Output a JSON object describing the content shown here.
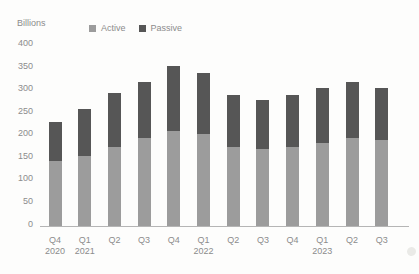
{
  "colors": {
    "background": "#fdfdfc",
    "text": "#8c8c8c",
    "axis_line": "#b5b5b5",
    "active": "#9c9c9c",
    "passive": "#565656"
  },
  "chart_data": {
    "type": "bar",
    "stacked": true,
    "ylabel": "Billions",
    "categories": [
      "Q4 2020",
      "Q1 2021",
      "Q2 2021",
      "Q3 2021",
      "Q4 2021",
      "Q1 2022",
      "Q2 2022",
      "Q3 2022",
      "Q4 2022",
      "Q1 2023",
      "Q2 2023",
      "Q3 2023"
    ],
    "x_ticks": [
      {
        "quarter": "Q4",
        "year": "2020"
      },
      {
        "quarter": "Q1",
        "year": "2021"
      },
      {
        "quarter": "Q2",
        "year": ""
      },
      {
        "quarter": "Q3",
        "year": ""
      },
      {
        "quarter": "Q4",
        "year": ""
      },
      {
        "quarter": "Q1",
        "year": "2022"
      },
      {
        "quarter": "Q2",
        "year": ""
      },
      {
        "quarter": "Q3",
        "year": ""
      },
      {
        "quarter": "Q4",
        "year": ""
      },
      {
        "quarter": "Q1",
        "year": "2023"
      },
      {
        "quarter": "Q2",
        "year": ""
      },
      {
        "quarter": "Q3",
        "year": ""
      }
    ],
    "series": [
      {
        "name": "Active",
        "color": "#9c9c9c",
        "values": [
          145,
          155,
          175,
          195,
          210,
          205,
          175,
          170,
          175,
          185,
          195,
          190
        ]
      },
      {
        "name": "Passive",
        "color": "#565656",
        "values": [
          85,
          105,
          120,
          125,
          145,
          135,
          115,
          110,
          115,
          120,
          125,
          115
        ]
      }
    ],
    "totals": [
      230,
      260,
      295,
      320,
      355,
      340,
      290,
      280,
      290,
      305,
      320,
      305
    ],
    "y_ticks": [
      400,
      350,
      300,
      250,
      200,
      150,
      100,
      50,
      0
    ],
    "ylim": [
      0,
      400
    ],
    "grid": false,
    "legend_position": "top"
  }
}
